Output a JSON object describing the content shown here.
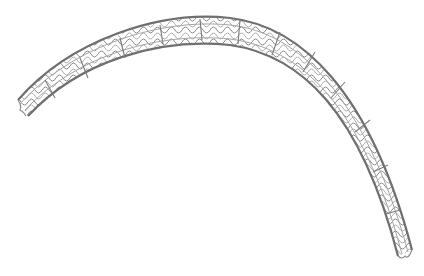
{
  "image": {
    "subject": "curved mesh stent",
    "background": "#ffffff",
    "colors": {
      "strut": "#8a8a8a",
      "strut_dark": "#555555",
      "strut_light": "#c8c8c8"
    }
  }
}
